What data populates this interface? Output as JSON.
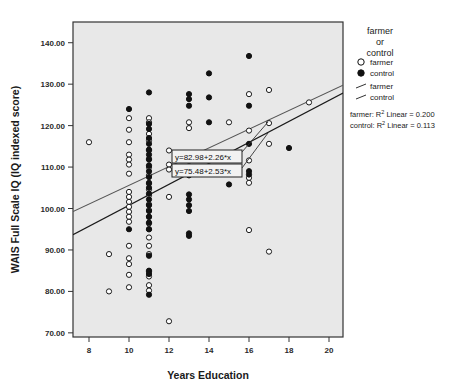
{
  "chart_data": {
    "type": "scatter",
    "title": "",
    "xlabel": "Years Education",
    "ylabel": "WAIS Full Scale IQ (IQ indexed score)",
    "xlim": [
      7.2,
      20.7
    ],
    "ylim": [
      69.0,
      145.0
    ],
    "xticks": [
      8,
      10,
      12,
      14,
      16,
      18,
      20
    ],
    "xtick_labels": [
      "8",
      "10",
      "12",
      "14",
      "16",
      "18",
      "20"
    ],
    "yticks": [
      70,
      80,
      90,
      100,
      110,
      120,
      130,
      140
    ],
    "ytick_labels": [
      "70.00",
      "80.00",
      "90.00",
      "100.00",
      "110.00",
      "120.00",
      "130.00",
      "140.00"
    ],
    "grid": false,
    "plot_bg": "#e8e8e8",
    "frame_color": "#333333",
    "legend_position": "outside-right-top",
    "legend_title": "farmer\nor\ncontrol",
    "legend_title_lines": [
      "farmer",
      "or",
      "control"
    ],
    "legend_entries": [
      {
        "label": "farmer",
        "marker": "open-circle",
        "kind": "marker"
      },
      {
        "label": "control",
        "marker": "filled-circle",
        "kind": "marker"
      },
      {
        "label": "farmer",
        "marker": "line",
        "kind": "line"
      },
      {
        "label": "control",
        "marker": "line",
        "kind": "line"
      }
    ],
    "r2_annotations": [
      "farmer: R² Linear = 0.200",
      "control: R² Linear = 0.113"
    ],
    "equation_labels": [
      "y=82.98+2.26*x",
      "y=75.48+2.53*x"
    ],
    "fit_lines": [
      {
        "name": "farmer",
        "equation": "y=82.98+2.26*x",
        "intercept": 82.98,
        "slope": 2.26,
        "r2": 0.2,
        "color": "#555555",
        "x_start": 7.2,
        "x_end": 20.7
      },
      {
        "name": "control",
        "equation": "y=75.48+2.53*x",
        "intercept": 75.48,
        "slope": 2.53,
        "r2": 0.113,
        "color": "#1a1a1a",
        "x_start": 7.2,
        "x_end": 20.7
      }
    ],
    "series": [
      {
        "name": "farmer",
        "marker": "open-circle",
        "color": "#ffffff",
        "edge_color": "#1a1a1a",
        "points": [
          [
            8,
            116.0
          ],
          [
            9,
            89.0
          ],
          [
            9,
            80.0
          ],
          [
            10,
            121.8
          ],
          [
            10,
            119.0
          ],
          [
            10,
            116.0
          ],
          [
            10,
            113.0
          ],
          [
            10,
            111.8
          ],
          [
            10,
            110.6
          ],
          [
            10,
            108.4
          ],
          [
            10,
            104.0
          ],
          [
            10,
            102.8
          ],
          [
            10,
            101.6
          ],
          [
            10,
            100.4
          ],
          [
            10,
            99.2
          ],
          [
            10,
            98.0
          ],
          [
            10,
            96.8
          ],
          [
            10,
            91.0
          ],
          [
            10,
            88.0
          ],
          [
            10,
            86.6
          ],
          [
            10,
            84.0
          ],
          [
            10,
            81.0
          ],
          [
            11,
            121.8
          ],
          [
            11,
            120.8
          ],
          [
            11,
            118.0
          ],
          [
            11,
            116.4
          ],
          [
            11,
            114.0
          ],
          [
            11,
            112.0
          ],
          [
            11,
            110.0
          ],
          [
            11,
            108.0
          ],
          [
            11,
            106.0
          ],
          [
            11,
            104.6
          ],
          [
            11,
            103.2
          ],
          [
            11,
            101.0
          ],
          [
            11,
            99.6
          ],
          [
            11,
            98.0
          ],
          [
            11,
            96.4
          ],
          [
            11,
            95.0
          ],
          [
            11,
            93.0
          ],
          [
            11,
            91.0
          ],
          [
            11,
            89.0
          ],
          [
            11,
            84.8
          ],
          [
            11,
            83.6
          ],
          [
            11,
            81.5
          ],
          [
            11,
            80.2
          ],
          [
            12,
            114.0
          ],
          [
            12,
            110.6
          ],
          [
            12,
            109.4
          ],
          [
            12,
            102.8
          ],
          [
            12,
            72.8
          ],
          [
            13,
            120.8
          ],
          [
            13,
            119.4
          ],
          [
            13,
            110.2
          ],
          [
            13,
            109.2
          ],
          [
            15,
            120.8
          ],
          [
            16,
            127.6
          ],
          [
            16,
            118.8
          ],
          [
            16,
            111.6
          ],
          [
            16,
            107.4
          ],
          [
            16,
            106.2
          ],
          [
            16,
            94.8
          ],
          [
            17,
            128.6
          ],
          [
            17,
            120.6
          ],
          [
            17,
            115.6
          ],
          [
            17,
            89.6
          ],
          [
            19,
            125.6
          ]
        ]
      },
      {
        "name": "control",
        "marker": "filled-circle",
        "color": "#111111",
        "edge_color": "#111111",
        "points": [
          [
            10,
            124.0
          ],
          [
            10,
            95.0
          ],
          [
            11,
            128.0
          ],
          [
            11,
            120.4
          ],
          [
            11,
            119.2
          ],
          [
            11,
            117.0
          ],
          [
            11,
            115.6
          ],
          [
            11,
            114.2
          ],
          [
            11,
            113.0
          ],
          [
            11,
            111.8
          ],
          [
            11,
            110.4
          ],
          [
            11,
            109.0
          ],
          [
            11,
            107.6
          ],
          [
            11,
            106.2
          ],
          [
            11,
            105.0
          ],
          [
            11,
            103.6
          ],
          [
            11,
            102.2
          ],
          [
            11,
            100.8
          ],
          [
            11,
            99.4
          ],
          [
            11,
            98.0
          ],
          [
            11,
            96.6
          ],
          [
            11,
            95.0
          ],
          [
            11,
            88.6
          ],
          [
            11,
            85.0
          ],
          [
            11,
            84.2
          ],
          [
            11,
            79.2
          ],
          [
            13,
            127.6
          ],
          [
            13,
            126.4
          ],
          [
            13,
            124.8
          ],
          [
            13,
            108.0
          ],
          [
            13,
            103.4
          ],
          [
            13,
            102.2
          ],
          [
            13,
            100.8
          ],
          [
            13,
            99.4
          ],
          [
            13,
            94.0
          ],
          [
            13,
            93.4
          ],
          [
            14,
            132.6
          ],
          [
            14,
            126.8
          ],
          [
            14,
            120.8
          ],
          [
            15,
            105.8
          ],
          [
            16,
            136.8
          ],
          [
            16,
            124.8
          ],
          [
            16,
            115.6
          ],
          [
            16,
            109.0
          ],
          [
            16,
            108.2
          ],
          [
            18,
            114.6
          ]
        ]
      }
    ]
  }
}
